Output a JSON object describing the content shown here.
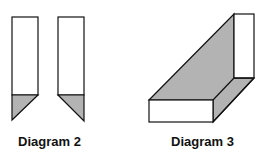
{
  "colors": {
    "stroke": "#111111",
    "fill_white": "#ffffff",
    "fill_gray": "#b3b3b3"
  },
  "diagrams": [
    {
      "caption": "Diagram 2"
    },
    {
      "caption": "Diagram 3"
    }
  ]
}
